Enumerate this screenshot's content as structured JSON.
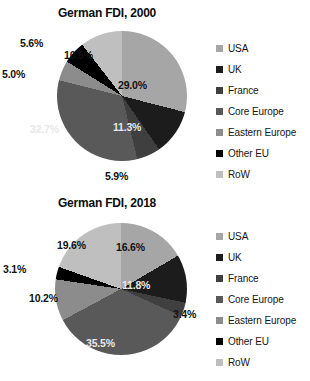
{
  "palette": {
    "usa": "#a6a6a6",
    "uk": "#1c1c1c",
    "france": "#3f3f3f",
    "core_europe": "#595959",
    "eastern_europe": "#8c8c8c",
    "other_eu": "#000000",
    "row": "#bfbfbf",
    "background": "#ffffff",
    "text": "#111111"
  },
  "legend": {
    "items": [
      {
        "label": "USA",
        "color": "#a6a6a6"
      },
      {
        "label": "UK",
        "color": "#1c1c1c"
      },
      {
        "label": "France",
        "color": "#3f3f3f"
      },
      {
        "label": "Core Europe",
        "color": "#595959"
      },
      {
        "label": "Eastern Europe",
        "color": "#8c8c8c"
      },
      {
        "label": "Other EU",
        "color": "#000000"
      },
      {
        "label": "RoW",
        "color": "#bfbfbf"
      }
    ]
  },
  "chart_data": [
    {
      "type": "pie",
      "title": "German FDI, 2000",
      "xlabel": "",
      "ylabel": "",
      "legend_position": "right",
      "grid": false,
      "categories": [
        "USA",
        "UK",
        "France",
        "Core Europe",
        "Eastern Europe",
        "Other EU",
        "RoW"
      ],
      "values": [
        29.0,
        11.3,
        5.9,
        32.7,
        5.0,
        5.6,
        10.5
      ],
      "colors": [
        "#a6a6a6",
        "#1c1c1c",
        "#3f3f3f",
        "#595959",
        "#8c8c8c",
        "#000000",
        "#bfbfbf"
      ],
      "data_labels": [
        "29.0%",
        "11.3%",
        "5.9%",
        "32.7%",
        "5.0%",
        "5.6%",
        "10.5%"
      ],
      "label_tone": [
        "dark",
        "light",
        "dark",
        "light",
        "dark",
        "dark",
        "dark"
      ],
      "label_pos": [
        {
          "left": 118,
          "top": 56
        },
        {
          "left": 113,
          "top": 98
        },
        {
          "left": 105,
          "top": 147
        },
        {
          "left": 30,
          "top": 100
        },
        {
          "left": 2,
          "top": 45
        },
        {
          "left": 20,
          "top": 14
        },
        {
          "left": 64,
          "top": 26
        }
      ]
    },
    {
      "type": "pie",
      "title": "German FDI, 2018",
      "xlabel": "",
      "ylabel": "",
      "legend_position": "right",
      "grid": false,
      "categories": [
        "USA",
        "UK",
        "France",
        "Core Europe",
        "Eastern Europe",
        "Other EU",
        "RoW"
      ],
      "values": [
        16.6,
        11.8,
        3.4,
        35.5,
        10.2,
        3.1,
        19.6
      ],
      "colors": [
        "#a6a6a6",
        "#1c1c1c",
        "#3f3f3f",
        "#595959",
        "#8c8c8c",
        "#000000",
        "#bfbfbf"
      ],
      "data_labels": [
        "16.6%",
        "11.8%",
        "3.4%",
        "35.5%",
        "10.2%",
        "3.1%",
        "19.6%"
      ],
      "label_tone": [
        "dark",
        "light",
        "dark",
        "light",
        "dark",
        "dark",
        "dark"
      ],
      "label_pos": [
        {
          "left": 116,
          "top": 28
        },
        {
          "left": 122,
          "top": 66
        },
        {
          "left": 173,
          "top": 95
        },
        {
          "left": 86,
          "top": 124
        },
        {
          "left": 29,
          "top": 79
        },
        {
          "left": 3,
          "top": 50
        },
        {
          "left": 57,
          "top": 26
        }
      ]
    }
  ]
}
